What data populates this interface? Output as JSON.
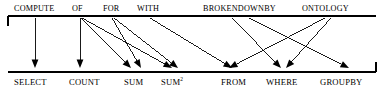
{
  "figure": {
    "type": "mapping-diagram",
    "stroke_color": "#000000",
    "background_color": "#ffffff"
  },
  "top_rail": {
    "name": "source-keyword-rail",
    "y": 16,
    "x_start": 8,
    "x_end": 376,
    "end_cap": "left-down-tick",
    "items": [
      {
        "label": "COMPUTE",
        "x": 14,
        "anchor_x": 35
      },
      {
        "label": "OF",
        "x": 72,
        "anchor_x": 80
      },
      {
        "label": "FOR",
        "x": 103,
        "anchor_x": 113
      },
      {
        "label": "WITH",
        "x": 137,
        "anchor_x": 150
      },
      {
        "label": "BROKENDOWNBY",
        "x": 203,
        "anchor_x": 243
      },
      {
        "label": "ONTOLOGY",
        "x": 302,
        "anchor_x": 330
      }
    ]
  },
  "bottom_rail": {
    "name": "target-sql-rail",
    "y": 72,
    "x_start": 8,
    "x_end": 376,
    "end_cap": "right-up-tick",
    "items": [
      {
        "label": "SELECT",
        "sup": "",
        "x": 14,
        "anchor_x": 35
      },
      {
        "label": "COUNT",
        "sup": "",
        "x": 69,
        "anchor_x": 91
      },
      {
        "label": "SUM",
        "sup": "",
        "x": 124,
        "anchor_x": 137
      },
      {
        "label": "SUM",
        "sup": "2",
        "x": 161,
        "anchor_x": 177
      },
      {
        "label": "FROM",
        "sup": "",
        "x": 221,
        "anchor_x": 239
      },
      {
        "label": "WHERE",
        "sup": "",
        "x": 266,
        "anchor_x": 288
      },
      {
        "label": "GROUPBY",
        "sup": "",
        "x": 320,
        "anchor_x": 348
      }
    ]
  },
  "edges": [
    {
      "name": "compute-to-select",
      "from": "COMPUTE",
      "to": "SELECT",
      "x1": 35,
      "y1": 18,
      "x2": 35,
      "y2": 68
    },
    {
      "name": "of-to-count",
      "from": "OF",
      "to": "COUNT",
      "x1": 80,
      "y1": 18,
      "x2": 80,
      "y2": 68
    },
    {
      "name": "of-to-sum",
      "from": "OF",
      "to": "SUM",
      "x1": 81,
      "y1": 18,
      "x2": 131,
      "y2": 68
    },
    {
      "name": "of-to-sum2",
      "from": "OF",
      "to": "SUM2",
      "x1": 82,
      "y1": 18,
      "x2": 172,
      "y2": 68
    },
    {
      "name": "for-to-sum",
      "from": "FOR",
      "to": "SUM",
      "x1": 112,
      "y1": 18,
      "x2": 141,
      "y2": 68
    },
    {
      "name": "for-to-sum2",
      "from": "FOR",
      "to": "SUM2",
      "x1": 114,
      "y1": 18,
      "x2": 178,
      "y2": 68
    },
    {
      "name": "with-to-from",
      "from": "WITH",
      "to": "FROM",
      "x1": 150,
      "y1": 18,
      "x2": 232,
      "y2": 68
    },
    {
      "name": "brokendownby-to-whereleft",
      "from": "BROKENDOWNBY",
      "to": "WHERE",
      "x1": 232,
      "y1": 18,
      "x2": 281,
      "y2": 68
    },
    {
      "name": "brokendownby-to-groupby",
      "from": "BROKENDOWNBY",
      "to": "GROUPBY",
      "x1": 249,
      "y1": 18,
      "x2": 349,
      "y2": 68
    },
    {
      "name": "ontology-to-from",
      "from": "ONTOLOGY",
      "to": "FROM",
      "x1": 325,
      "y1": 18,
      "x2": 229,
      "y2": 68
    },
    {
      "name": "ontology-to-where",
      "from": "ONTOLOGY",
      "to": "WHERE",
      "x1": 331,
      "y1": 18,
      "x2": 286,
      "y2": 68
    }
  ]
}
